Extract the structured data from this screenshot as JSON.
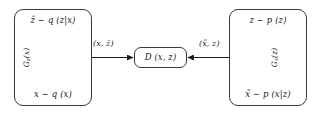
{
  "diagram": {
    "nodes": {
      "encoder": {
        "name": "encoder-box",
        "input_label": "x ∼ q (x)",
        "output_label": "ẑ ∼ q (z|x)",
        "function_label_base": "G",
        "function_label_sub": "z",
        "function_label_arg": "(x)",
        "function_label_full": "G_z(x)",
        "arrow_direction": "up"
      },
      "decoder": {
        "name": "decoder-box",
        "input_label": "z ∼ p (z)",
        "output_label": "x̃ ∼ p (x|z)",
        "function_label_base": "G",
        "function_label_sub": "x",
        "function_label_arg": "(z)",
        "function_label_full": "G_x(z)",
        "arrow_direction": "down"
      },
      "discriminator": {
        "name": "discriminator-box",
        "label": "D (x, z)"
      }
    },
    "edges": {
      "encoder_to_discriminator": {
        "label": "(x, ẑ)",
        "direction": "right"
      },
      "decoder_to_discriminator": {
        "label": "(x̃, z)",
        "direction": "left"
      }
    },
    "colors": {
      "stroke": "#3a3a3a",
      "text": "#1a1a1a",
      "background": "#ffffff"
    }
  }
}
